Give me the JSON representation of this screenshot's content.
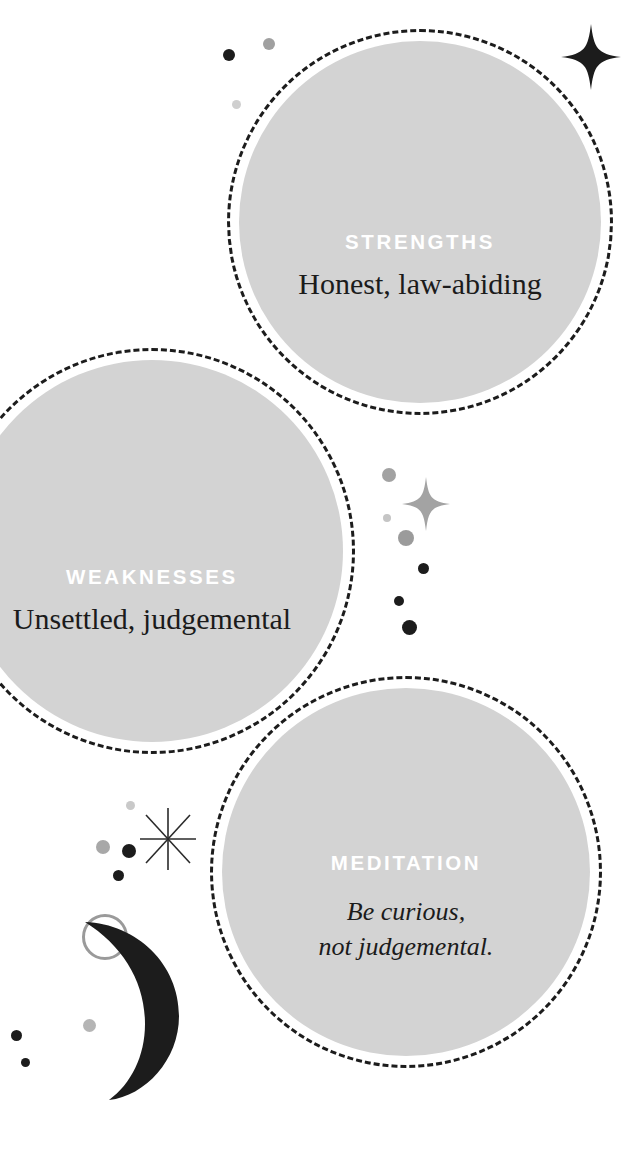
{
  "page": {
    "background_color": "#ffffff",
    "bubble_fill_color": "#d3d3d3",
    "bubble_border_color": "#1c1c1c",
    "kicker_color": "#ffffff",
    "body_text_color": "#1b1b1b",
    "accent_dark": "#1c1c1c",
    "accent_gray": "#9a9a9a",
    "accent_light_gray": "#c9c9c9"
  },
  "bubbles": [
    {
      "id": "strengths",
      "kicker": "STRENGTHS",
      "body": "Honest, law-abiding",
      "body_style": "roman"
    },
    {
      "id": "weaknesses",
      "kicker": "WEAKNESSES",
      "body": "Unsettled, judgemental",
      "body_style": "roman"
    },
    {
      "id": "meditation",
      "kicker": "MEDITATION",
      "body_line1": "Be curious,",
      "body_line2": "not judgemental.",
      "body_style": "italic"
    }
  ],
  "decorations": {
    "sparkle_top_right": "four-point-star-icon",
    "sparkle_middle": "four-point-star-icon",
    "starburst_bottom_left": "eight-point-starburst-icon",
    "crescent_moon": "crescent-moon-icon",
    "outline_circle": "circle-outline-icon",
    "dots": "dot-icon"
  }
}
